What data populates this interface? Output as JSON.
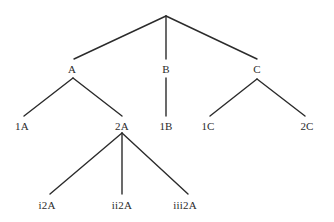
{
  "diagram": {
    "type": "tree",
    "background_color": "#ffffff",
    "line_color": "#2b2b2b",
    "text_color": "#2b2b2b",
    "line_width": 1.4,
    "nodes": [
      {
        "id": "root",
        "label": "",
        "x": 166,
        "y": 16,
        "level": 0,
        "visible_label": false
      },
      {
        "id": "A",
        "label": "A",
        "x": 72,
        "y": 69,
        "level": 1,
        "visible_label": true
      },
      {
        "id": "B",
        "label": "B",
        "x": 166,
        "y": 69,
        "level": 1,
        "visible_label": true
      },
      {
        "id": "C",
        "label": "C",
        "x": 257,
        "y": 69,
        "level": 1,
        "visible_label": true
      },
      {
        "id": "1A",
        "label": "1A",
        "x": 22,
        "y": 126,
        "level": 2,
        "visible_label": true
      },
      {
        "id": "2A",
        "label": "2A",
        "x": 122,
        "y": 126,
        "level": 2,
        "visible_label": true
      },
      {
        "id": "1B",
        "label": "1B",
        "x": 166,
        "y": 126,
        "level": 2,
        "visible_label": true
      },
      {
        "id": "1C",
        "label": "1C",
        "x": 208,
        "y": 126,
        "level": 2,
        "visible_label": true
      },
      {
        "id": "2C",
        "label": "2C",
        "x": 307,
        "y": 126,
        "level": 2,
        "visible_label": true
      },
      {
        "id": "i2A",
        "label": "i2A",
        "x": 47,
        "y": 205,
        "level": 3,
        "visible_label": true
      },
      {
        "id": "ii2A",
        "label": "ii2A",
        "x": 122,
        "y": 205,
        "level": 3,
        "visible_label": true
      },
      {
        "id": "iii2A",
        "label": "iii2A",
        "x": 185,
        "y": 205,
        "level": 3,
        "visible_label": true
      }
    ],
    "edges": [
      {
        "from": "root",
        "to": "A",
        "x1": 166,
        "y1": 16,
        "x2": 74,
        "y2": 59
      },
      {
        "from": "root",
        "to": "B",
        "x1": 166,
        "y1": 16,
        "x2": 166,
        "y2": 59
      },
      {
        "from": "root",
        "to": "C",
        "x1": 166,
        "y1": 16,
        "x2": 257,
        "y2": 59
      },
      {
        "from": "A",
        "to": "1A",
        "x1": 73,
        "y1": 78,
        "x2": 24,
        "y2": 116
      },
      {
        "from": "A",
        "to": "2A",
        "x1": 73,
        "y1": 78,
        "x2": 122,
        "y2": 116
      },
      {
        "from": "B",
        "to": "1B",
        "x1": 166,
        "y1": 78,
        "x2": 166,
        "y2": 116
      },
      {
        "from": "C",
        "to": "1C",
        "x1": 257,
        "y1": 79,
        "x2": 210,
        "y2": 116
      },
      {
        "from": "C",
        "to": "2C",
        "x1": 257,
        "y1": 79,
        "x2": 305,
        "y2": 116
      },
      {
        "from": "2A",
        "to": "i2A",
        "x1": 122,
        "y1": 133,
        "x2": 50,
        "y2": 194
      },
      {
        "from": "2A",
        "to": "ii2A",
        "x1": 122,
        "y1": 133,
        "x2": 122,
        "y2": 194
      },
      {
        "from": "2A",
        "to": "iii2A",
        "x1": 122,
        "y1": 133,
        "x2": 188,
        "y2": 194
      }
    ]
  }
}
